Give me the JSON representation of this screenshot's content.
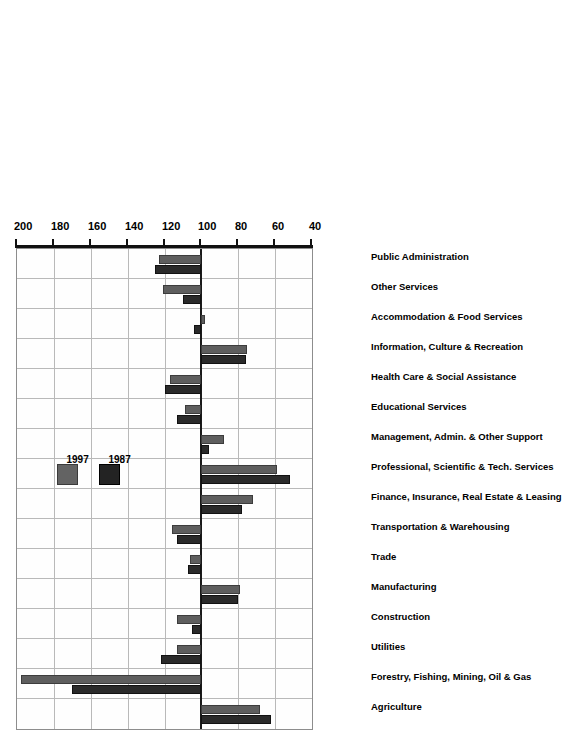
{
  "chart_data": {
    "type": "bar",
    "orientation": "vertical-rotated",
    "title": "",
    "subtitle": "",
    "xlabel": "",
    "ylabel": "",
    "ylim": [
      40,
      200
    ],
    "baseline": 100,
    "grid": true,
    "legend_position": "inside-plot",
    "tick_labels": [
      "40",
      "60",
      "80",
      "100",
      "120",
      "140",
      "160",
      "180",
      "200"
    ],
    "ticks": [
      40,
      60,
      80,
      100,
      120,
      140,
      160,
      180,
      200
    ],
    "categories": [
      "Agriculture",
      "Forestry, Fishing, Mining, Oil & Gas",
      "Utilities",
      "Construction",
      "Manufacturing",
      "Trade",
      "Transportation & Warehousing",
      "Finance, Insurance, Real Estate & Leasing",
      "Professional, Scientific & Tech. Services",
      "Management, Admin. & Other Support",
      "Educational Services",
      "Health Care & Social Assistance",
      "Information, Culture & Recreation",
      "Accommodation & Food Services",
      "Other Services",
      "Public Administration"
    ],
    "series": [
      {
        "name": "1987",
        "color": "#232323",
        "values": [
          62,
          170,
          122,
          105,
          80,
          107,
          113,
          78,
          52,
          96,
          113,
          120,
          76,
          104,
          110,
          125
        ]
      },
      {
        "name": "1997",
        "color": "#636363",
        "values": [
          68,
          198,
          113,
          113,
          79,
          106,
          116,
          72,
          59,
          88,
          109,
          117,
          75,
          98,
          121,
          123
        ]
      }
    ],
    "legend": [
      {
        "label": "1987",
        "color": "#232323"
      },
      {
        "label": "1997",
        "color": "#636363"
      }
    ]
  }
}
